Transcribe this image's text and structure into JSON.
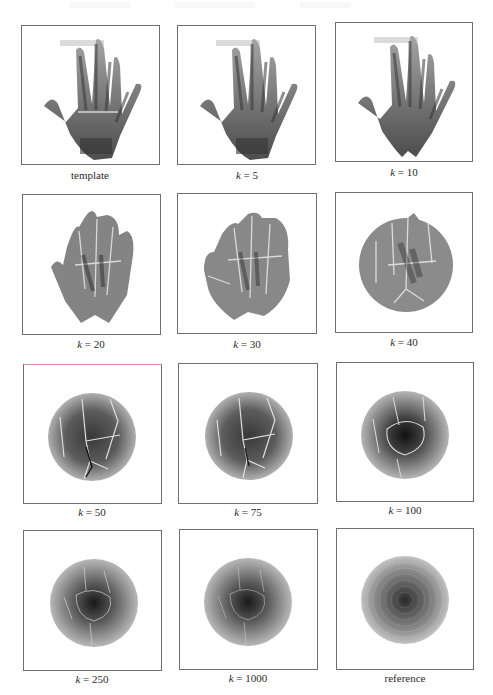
{
  "figure": {
    "panels": [
      {
        "id": "template",
        "caption": "template",
        "kind": "hand",
        "stage": 0
      },
      {
        "id": "k5",
        "caption_var": "k",
        "caption_value": "= 5",
        "kind": "hand",
        "stage": 1
      },
      {
        "id": "k10",
        "caption_var": "k",
        "caption_value": "= 10",
        "kind": "hand",
        "stage": 2
      },
      {
        "id": "k20",
        "caption_var": "k",
        "caption_value": "= 20",
        "kind": "warp",
        "stage": 3
      },
      {
        "id": "k30",
        "caption_var": "k",
        "caption_value": "= 30",
        "kind": "warp",
        "stage": 4
      },
      {
        "id": "k40",
        "caption_var": "k",
        "caption_value": "= 40",
        "kind": "warp",
        "stage": 5
      },
      {
        "id": "k50",
        "caption_var": "k",
        "caption_value": "= 50",
        "kind": "disc-veined",
        "stage": 6
      },
      {
        "id": "k75",
        "caption_var": "k",
        "caption_value": "= 75",
        "kind": "disc-veined",
        "stage": 7
      },
      {
        "id": "k100",
        "caption_var": "k",
        "caption_value": "= 100",
        "kind": "disc-veined",
        "stage": 8
      },
      {
        "id": "k250",
        "caption_var": "k",
        "caption_value": "= 250",
        "kind": "disc-faint",
        "stage": 9
      },
      {
        "id": "k1000",
        "caption_var": "k",
        "caption_value": "= 1000",
        "kind": "disc-faint",
        "stage": 10
      },
      {
        "id": "reference",
        "caption": "reference",
        "kind": "disc-reference",
        "stage": 11
      }
    ]
  },
  "colors": {
    "frame_border": "#6f6f6f",
    "frame_border_tint": "#e08aa0",
    "image_dark": "#1e1e1e",
    "image_mid": "#7a7a7a",
    "image_light": "#c8c8c8"
  }
}
